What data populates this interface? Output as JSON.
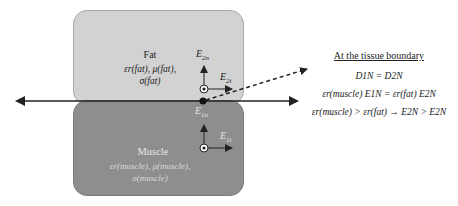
{
  "diagram": {
    "colors": {
      "fat_fill": "#d2d2d2",
      "muscle_fill": "#8e8e8e",
      "line": "#222222"
    },
    "fat": {
      "title": "Fat",
      "props_line1": "εr(fat), μ(fat),",
      "props_line2": "σ(fat)"
    },
    "muscle": {
      "title": "Muscle",
      "props_line1": "εr(muscle), μ(muscle),",
      "props_line2": "σ(muscle)"
    },
    "vectors": {
      "e2n": {
        "base": "E",
        "sub": "2n"
      },
      "e2t": {
        "base": "E",
        "sub": "2t"
      },
      "e1n": {
        "base": "E",
        "sub": "1n"
      },
      "e1t": {
        "base": "E",
        "sub": "1t"
      }
    },
    "panel": {
      "heading": "At the tissue boundary",
      "eq1": "D1N = D2N",
      "eq2": "εr(muscle) E1N = εr(fat) E2N",
      "eq3": "εr(muscle) > εr(fat) → E2N > E2N"
    }
  }
}
